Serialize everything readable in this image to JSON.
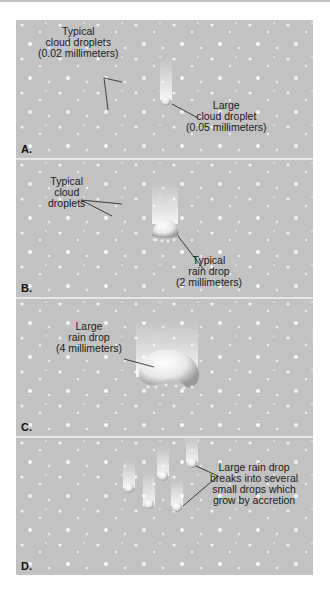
{
  "figure": {
    "colors": {
      "panel_background": "#c2c2c2",
      "divider": "#e6e6e6",
      "droplet": "#f2f2f2",
      "text": "#1a1a1a"
    },
    "panels": [
      {
        "letter": "A.",
        "labels": [
          {
            "id": "typical-cloud-droplets",
            "text": "Typical\ncloud droplets\n(0.02 millimeters)"
          },
          {
            "id": "large-cloud-droplet",
            "text": "Large\ncloud droplet\n(0.05 millimeters)"
          }
        ]
      },
      {
        "letter": "B.",
        "labels": [
          {
            "id": "typical-cloud-droplets",
            "text": "Typical\ncloud\ndroplets"
          },
          {
            "id": "typical-rain-drop",
            "text": "Typical\nrain drop\n(2 millimeters)"
          }
        ]
      },
      {
        "letter": "C.",
        "labels": [
          {
            "id": "large-rain-drop",
            "text": "Large\nrain drop\n(4 millimeters)"
          }
        ]
      },
      {
        "letter": "D.",
        "labels": [
          {
            "id": "rain-drop-breakup",
            "text": "Large rain drop\nbreaks into several\nsmall drops which\ngrow by accretion"
          }
        ]
      }
    ]
  }
}
